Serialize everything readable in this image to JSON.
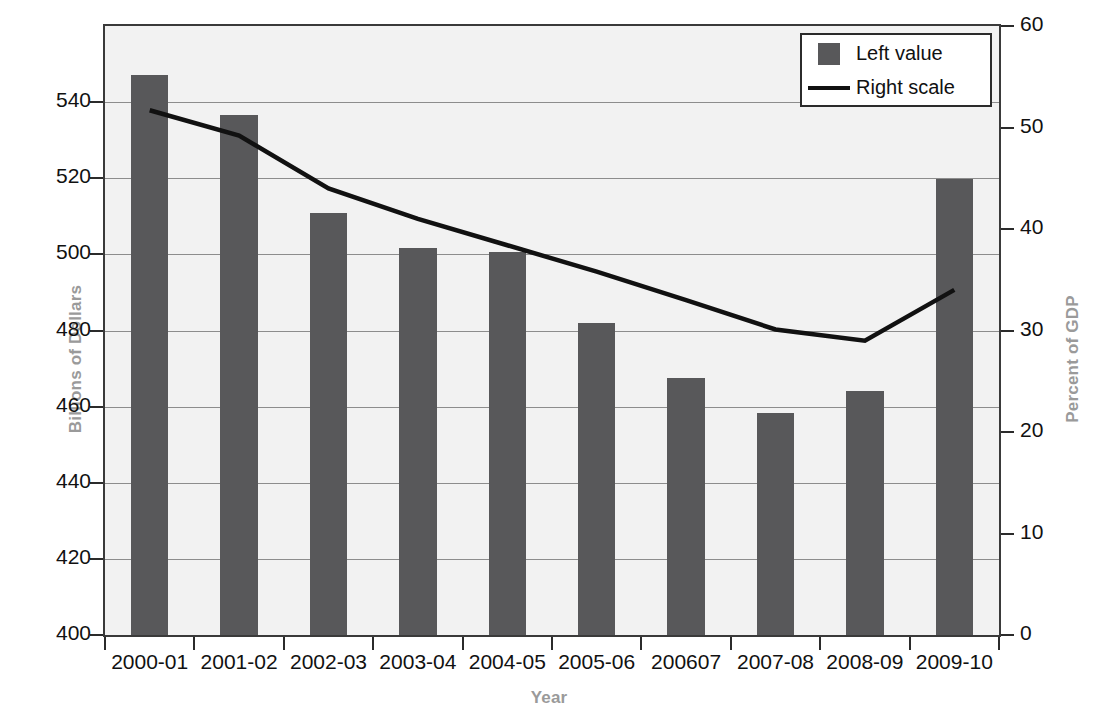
{
  "chart_data": {
    "type": "bar",
    "title": "",
    "subtitle": "",
    "xlabel": "Year",
    "ylabel": "Billions of Dollars",
    "ylabel_right": "Percent of GDP",
    "categories": [
      "2000-01",
      "2001-02",
      "2002-03",
      "2003-04",
      "2004-05",
      "2005-06",
      "200607",
      "2007-08",
      "2008-09",
      "2009-10"
    ],
    "ylim": [
      400,
      560
    ],
    "yticks": [
      400,
      420,
      440,
      460,
      480,
      500,
      520,
      540
    ],
    "ylim_right": [
      0,
      60
    ],
    "yticks_right": [
      0,
      10,
      20,
      30,
      40,
      50,
      60
    ],
    "grid": true,
    "legend_position": "top-right",
    "series": [
      {
        "name": "Left value",
        "type": "bar",
        "axis": "left",
        "color": "#58585a",
        "values": [
          547,
          536.5,
          511,
          501.8,
          500.6,
          482,
          467.6,
          458.2,
          464.2,
          519.8
        ]
      },
      {
        "name": "Right scale",
        "type": "line",
        "axis": "right",
        "color": "#111111",
        "values": [
          51.7,
          49.2,
          44.0,
          41.0,
          38.4,
          35.8,
          33.0,
          30.1,
          29.0,
          34.0
        ]
      }
    ]
  },
  "legend": {
    "entries": [
      {
        "label": "Left value",
        "marker": "square"
      },
      {
        "label": "Right scale",
        "marker": "line"
      }
    ]
  },
  "axes": {
    "left_title": "Billions of Dollars",
    "right_title": "Percent of GDP",
    "bottom_title": "Year"
  },
  "colors": {
    "bar": "#58585a",
    "line": "#111111",
    "plot_background": "#f2f2f2",
    "frame": "#3a3a3a",
    "grid": "#8d8d8d",
    "axis_title": "#9a9a9a",
    "tick_label": "#111111"
  }
}
